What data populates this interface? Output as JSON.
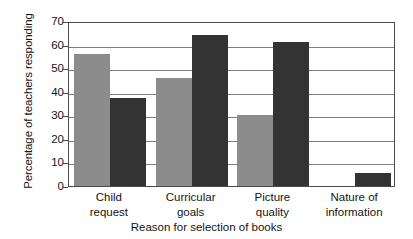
{
  "chart_data": {
    "type": "bar",
    "title": "",
    "xlabel": "Reason for selection of books",
    "ylabel": "Percentage of teachers responding",
    "categories": [
      "Child request",
      "Curricular goals",
      "Picture quality",
      "Nature of information"
    ],
    "category_lines": [
      [
        "Child",
        "request"
      ],
      [
        "Curricular",
        "goals"
      ],
      [
        "Picture",
        "quality"
      ],
      [
        "Nature of",
        "information"
      ]
    ],
    "series": [
      {
        "name": "Series A",
        "color": "#8c8c8c",
        "values": [
          56,
          46,
          30,
          0
        ]
      },
      {
        "name": "Series B",
        "color": "#333333",
        "values": [
          37.5,
          64,
          61,
          5.5
        ]
      }
    ],
    "ylim": [
      0,
      70
    ],
    "yticks": [
      0,
      10,
      20,
      30,
      40,
      50,
      60,
      70
    ],
    "ytick_labels": [
      "0",
      "10",
      "20",
      "30",
      "40",
      "50",
      "60",
      "70"
    ],
    "grid": true,
    "grid_axis": "y",
    "legend": "none",
    "frame_color": "#4a4a4a",
    "grid_color": "#7d7d7d",
    "background": "#ffffff"
  }
}
